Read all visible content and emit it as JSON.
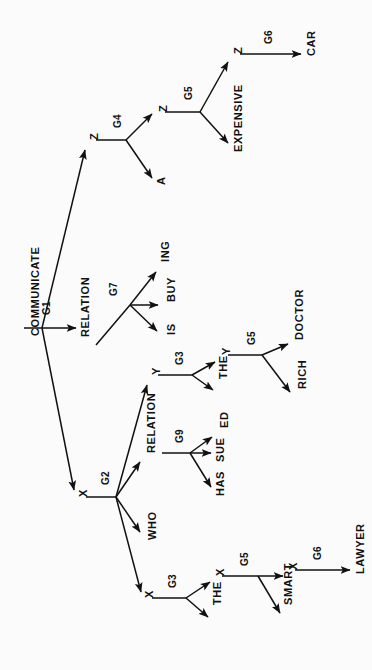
{
  "figure": {
    "kind": "derivation-tree",
    "orientation": "rotated-90-ccw",
    "ink_color": "#111111",
    "background_color": "#fbfbfb",
    "root_label": "COMMUNICATE"
  },
  "nodes": {
    "root": {
      "text": "COMMUNICATE",
      "x": 30,
      "y": 336,
      "size": 11
    },
    "relation1": {
      "text": "RELATION",
      "x": 80,
      "y": 337,
      "size": 11
    },
    "is": {
      "text": "IS",
      "x": 166,
      "y": 335,
      "size": 11
    },
    "buy": {
      "text": "BUY",
      "x": 166,
      "y": 302,
      "size": 11
    },
    "ing": {
      "text": "ING",
      "x": 160,
      "y": 262,
      "size": 11
    },
    "ztop": {
      "text": "Z",
      "x": 89,
      "y": 140,
      "size": 11
    },
    "a": {
      "text": "A",
      "x": 156,
      "y": 185,
      "size": 11
    },
    "zmid": {
      "text": "Z",
      "x": 158,
      "y": 112,
      "size": 11
    },
    "expensive": {
      "text": "EXPENSIVE",
      "x": 233,
      "y": 152,
      "size": 11
    },
    "ztop2": {
      "text": "Z",
      "x": 233,
      "y": 54,
      "size": 11
    },
    "car": {
      "text": "CAR",
      "x": 306,
      "y": 56,
      "size": 11
    },
    "xmain": {
      "text": "X",
      "x": 78,
      "y": 497,
      "size": 11
    },
    "who": {
      "text": "WHO",
      "x": 147,
      "y": 540,
      "size": 11
    },
    "relation2": {
      "text": "RELATION",
      "x": 146,
      "y": 453,
      "size": 11
    },
    "has": {
      "text": "HAS",
      "x": 215,
      "y": 496,
      "size": 11
    },
    "sue": {
      "text": "SUE",
      "x": 215,
      "y": 462,
      "size": 11
    },
    "ed": {
      "text": "ED",
      "x": 219,
      "y": 428,
      "size": 11
    },
    "ybranch": {
      "text": "Y",
      "x": 151,
      "y": 375,
      "size": 11
    },
    "the1": {
      "text": "THE",
      "x": 218,
      "y": 379,
      "size": 11
    },
    "ynode": {
      "text": "Y",
      "x": 221,
      "y": 355,
      "size": 11
    },
    "rich": {
      "text": "RICH",
      "x": 297,
      "y": 389,
      "size": 11
    },
    "doctor": {
      "text": "DOCTOR",
      "x": 294,
      "y": 340,
      "size": 11
    },
    "xbranch": {
      "text": "X",
      "x": 144,
      "y": 598,
      "size": 11
    },
    "the2": {
      "text": "THE",
      "x": 212,
      "y": 605,
      "size": 11
    },
    "xnode": {
      "text": "X",
      "x": 215,
      "y": 576,
      "size": 11
    },
    "smart": {
      "text": "SMART",
      "x": 283,
      "y": 605,
      "size": 11
    },
    "xleaf": {
      "text": "X",
      "x": 288,
      "y": 570,
      "size": 11
    },
    "lawyer": {
      "text": "LAWYER",
      "x": 355,
      "y": 574,
      "size": 11
    }
  },
  "edges": [
    {
      "id": "e-g1-relation",
      "label": "G1",
      "from": "COMMUNICATE",
      "to": "RELATION",
      "lx": 42,
      "ly": 315
    },
    {
      "id": "e-g1-x",
      "label": "G1",
      "from": "COMMUNICATE",
      "to": "X",
      "lx": 0,
      "ly": 0
    },
    {
      "id": "e-g1-z",
      "label": "G1",
      "from": "COMMUNICATE",
      "to": "Z",
      "lx": 0,
      "ly": 0
    },
    {
      "id": "e-g7",
      "label": "G7",
      "from": "RELATION",
      "to": "IS/BUY/ING",
      "lx": 109,
      "ly": 296
    },
    {
      "id": "e-g4",
      "label": "G4",
      "from": "Z",
      "to": "A/Z",
      "lx": 113,
      "ly": 128
    },
    {
      "id": "e-g5-top",
      "label": "G5",
      "from": "Z",
      "to": "EXPENSIVE/Z",
      "lx": 184,
      "ly": 80
    },
    {
      "id": "e-g6-car",
      "label": "G6",
      "from": "Z",
      "to": "CAR",
      "lx": 264,
      "ly": 40
    },
    {
      "id": "e-g2",
      "label": "G2",
      "from": "X",
      "to": "X/WHO/RELATION/Y",
      "lx": 101,
      "ly": 485
    },
    {
      "id": "e-g9",
      "label": "G9",
      "from": "RELATION",
      "to": "HAS/SUE/ED",
      "lx": 175,
      "ly": 443
    },
    {
      "id": "e-g3-y",
      "label": "G3",
      "from": "Y",
      "to": "THE/Y",
      "lx": 175,
      "ly": 353
    },
    {
      "id": "e-g5-y",
      "label": "G5",
      "from": "Y",
      "to": "RICH/DOCTOR",
      "lx": 247,
      "ly": 340
    },
    {
      "id": "e-g3-x",
      "label": "G3",
      "from": "X",
      "to": "THE/X",
      "lx": 168,
      "ly": 583
    },
    {
      "id": "e-g5-x",
      "label": "G5",
      "from": "X",
      "to": "SMART/X",
      "lx": 240,
      "ly": 563
    },
    {
      "id": "e-g6-lawyer",
      "label": "G6",
      "from": "X",
      "to": "LAWYER",
      "lx": 313,
      "ly": 557
    }
  ],
  "edge_label_text": {
    "g1": "G1",
    "g2": "G2",
    "g3": "G3",
    "g4": "G4",
    "g5": "G5",
    "g6": "G6",
    "g7": "G7",
    "g9": "G9"
  }
}
